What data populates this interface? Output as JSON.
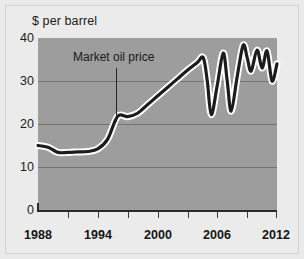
{
  "figure": {
    "title": "",
    "y_axis_label": "$ per barrel",
    "annotation": "Market oil price"
  },
  "axes": {
    "y_ticks": [
      "0",
      "10",
      "20",
      "30",
      "40"
    ],
    "x_ticks": [
      "1988",
      "1994",
      "2000",
      "2006",
      "2012"
    ]
  },
  "colors": {
    "plot_background": "#9d9d9d",
    "figure_background": "#ebebeb",
    "line": "#1c1c1c",
    "line_halo": "#ffffff",
    "gridline": "#737373",
    "axis": "#2b2b2b",
    "text": "#1b1b1b"
  },
  "chart_data": {
    "type": "line",
    "title": "",
    "xlabel": "",
    "ylabel": "$ per barrel",
    "xlim": [
      1988,
      2012
    ],
    "ylim": [
      0,
      40
    ],
    "y_ticks": [
      0,
      10,
      20,
      30,
      40
    ],
    "x_ticks": [
      1988,
      1994,
      2000,
      2006,
      2012
    ],
    "x_minor_tick_interval": 3,
    "grid": "horizontal",
    "legend": "none",
    "annotations": [
      {
        "text": "Market oil price",
        "x": 1996,
        "y": 33,
        "pointer_to": {
          "x": 1996,
          "y": 21.5
        }
      }
    ],
    "series": [
      {
        "name": "Market oil price",
        "units": "$ per barrel",
        "x": [
          1988,
          1989,
          1990,
          1991,
          1992,
          1993,
          1994,
          1995,
          1996,
          1997,
          1998,
          1999,
          2000,
          2001,
          2002,
          2003,
          2004,
          2004.6,
          2005,
          2005.4,
          2006,
          2006.6,
          2007,
          2007.4,
          2008,
          2008.6,
          2009,
          2009.4,
          2010,
          2010.5,
          2011,
          2011.5,
          2012
        ],
        "values": [
          15.0,
          14.6,
          13.4,
          13.4,
          13.5,
          13.6,
          14.2,
          16.5,
          21.8,
          21.7,
          22.5,
          24.5,
          26.5,
          28.5,
          30.5,
          32.5,
          34.3,
          35.4,
          30.0,
          22.2,
          29.0,
          36.5,
          30.0,
          23.0,
          31.0,
          38.3,
          35.5,
          32.3,
          37.2,
          33.0,
          37.0,
          30.0,
          34.0
        ]
      }
    ]
  }
}
